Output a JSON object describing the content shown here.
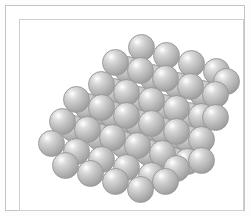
{
  "figure": {
    "background_color": "#fdfdfd",
    "frame": {
      "outer_border_color": "#c4c4c4",
      "inner_border_color": "#cfcfcf",
      "fill_color": "#ffffff"
    },
    "sphere_style": {
      "diameter_px": 27,
      "highlight_color": "#ffffff",
      "body_color": "#c3c3c3",
      "shadow_color": "#8d8d8d",
      "outline_color": "#9a9a9a",
      "highlight_position": "upper-left"
    },
    "lattice": {
      "packing": "close-packed",
      "shape": "rhombohedral",
      "layer_count": 4,
      "sphere_count": 62
    }
  },
  "chart_data": {
    "type": "scatter",
    "xlabel": "",
    "ylabel": "",
    "legend": [],
    "grid": false,
    "xlim": [
      0,
      225
    ],
    "ylim": [
      0,
      192
    ],
    "note": "Each point is the center of one rendered sphere; r = radius in px, layer = stacking depth (0 = back, 3 = front)",
    "spheres": [
      {
        "x": 122,
        "y": 28,
        "r": 13.5,
        "layer": 0
      },
      {
        "x": 147,
        "y": 36,
        "r": 13.5,
        "layer": 0
      },
      {
        "x": 172,
        "y": 44,
        "r": 13.5,
        "layer": 0
      },
      {
        "x": 197,
        "y": 52,
        "r": 13.5,
        "layer": 0
      },
      {
        "x": 108,
        "y": 50,
        "r": 13.5,
        "layer": 0
      },
      {
        "x": 133,
        "y": 58,
        "r": 13.5,
        "layer": 0
      },
      {
        "x": 158,
        "y": 66,
        "r": 13.5,
        "layer": 0
      },
      {
        "x": 183,
        "y": 74,
        "r": 13.5,
        "layer": 0
      },
      {
        "x": 94,
        "y": 72,
        "r": 13.5,
        "layer": 0
      },
      {
        "x": 119,
        "y": 80,
        "r": 13.5,
        "layer": 0
      },
      {
        "x": 144,
        "y": 88,
        "r": 13.5,
        "layer": 0
      },
      {
        "x": 169,
        "y": 96,
        "r": 13.5,
        "layer": 0
      },
      {
        "x": 80,
        "y": 94,
        "r": 13.5,
        "layer": 0
      },
      {
        "x": 105,
        "y": 102,
        "r": 13.5,
        "layer": 0
      },
      {
        "x": 130,
        "y": 110,
        "r": 13.5,
        "layer": 0
      },
      {
        "x": 155,
        "y": 118,
        "r": 13.5,
        "layer": 0
      },
      {
        "x": 96,
        "y": 43,
        "r": 13.5,
        "layer": 1
      },
      {
        "x": 121,
        "y": 51,
        "r": 13.5,
        "layer": 1
      },
      {
        "x": 146,
        "y": 59,
        "r": 13.5,
        "layer": 1
      },
      {
        "x": 171,
        "y": 67,
        "r": 13.5,
        "layer": 1
      },
      {
        "x": 196,
        "y": 75,
        "r": 13.5,
        "layer": 1
      },
      {
        "x": 82,
        "y": 65,
        "r": 13.5,
        "layer": 1
      },
      {
        "x": 107,
        "y": 73,
        "r": 13.5,
        "layer": 1
      },
      {
        "x": 132,
        "y": 81,
        "r": 13.5,
        "layer": 1
      },
      {
        "x": 157,
        "y": 89,
        "r": 13.5,
        "layer": 1
      },
      {
        "x": 182,
        "y": 97,
        "r": 13.5,
        "layer": 1
      },
      {
        "x": 68,
        "y": 87,
        "r": 13.5,
        "layer": 1
      },
      {
        "x": 93,
        "y": 95,
        "r": 13.5,
        "layer": 1
      },
      {
        "x": 118,
        "y": 103,
        "r": 13.5,
        "layer": 1
      },
      {
        "x": 143,
        "y": 111,
        "r": 13.5,
        "layer": 1
      },
      {
        "x": 168,
        "y": 119,
        "r": 13.5,
        "layer": 1
      },
      {
        "x": 54,
        "y": 109,
        "r": 13.5,
        "layer": 1
      },
      {
        "x": 79,
        "y": 117,
        "r": 13.5,
        "layer": 1
      },
      {
        "x": 104,
        "y": 125,
        "r": 13.5,
        "layer": 1
      },
      {
        "x": 129,
        "y": 133,
        "r": 13.5,
        "layer": 1
      },
      {
        "x": 154,
        "y": 141,
        "r": 13.5,
        "layer": 1
      },
      {
        "x": 57,
        "y": 80,
        "r": 13.5,
        "layer": 2
      },
      {
        "x": 82,
        "y": 88,
        "r": 13.5,
        "layer": 2
      },
      {
        "x": 107,
        "y": 96,
        "r": 13.5,
        "layer": 2
      },
      {
        "x": 132,
        "y": 104,
        "r": 13.5,
        "layer": 2
      },
      {
        "x": 157,
        "y": 112,
        "r": 13.5,
        "layer": 2
      },
      {
        "x": 182,
        "y": 120,
        "r": 13.5,
        "layer": 2
      },
      {
        "x": 43,
        "y": 102,
        "r": 13.5,
        "layer": 2
      },
      {
        "x": 68,
        "y": 110,
        "r": 13.5,
        "layer": 2
      },
      {
        "x": 93,
        "y": 118,
        "r": 13.5,
        "layer": 2
      },
      {
        "x": 118,
        "y": 126,
        "r": 13.5,
        "layer": 2
      },
      {
        "x": 143,
        "y": 134,
        "r": 13.5,
        "layer": 2
      },
      {
        "x": 168,
        "y": 142,
        "r": 13.5,
        "layer": 2
      },
      {
        "x": 32,
        "y": 124,
        "r": 13.5,
        "layer": 3
      },
      {
        "x": 57,
        "y": 132,
        "r": 13.5,
        "layer": 3
      },
      {
        "x": 82,
        "y": 140,
        "r": 13.5,
        "layer": 3
      },
      {
        "x": 107,
        "y": 148,
        "r": 13.5,
        "layer": 3
      },
      {
        "x": 132,
        "y": 156,
        "r": 13.5,
        "layer": 3
      },
      {
        "x": 157,
        "y": 149,
        "r": 13.5,
        "layer": 3
      },
      {
        "x": 182,
        "y": 141,
        "r": 13.5,
        "layer": 3
      },
      {
        "x": 46,
        "y": 146,
        "r": 13.5,
        "layer": 3
      },
      {
        "x": 71,
        "y": 154,
        "r": 13.5,
        "layer": 3
      },
      {
        "x": 96,
        "y": 162,
        "r": 13.5,
        "layer": 3
      },
      {
        "x": 121,
        "y": 170,
        "r": 13.5,
        "layer": 3
      },
      {
        "x": 146,
        "y": 162,
        "r": 13.5,
        "layer": 3
      },
      {
        "x": 196,
        "y": 98,
        "r": 13.5,
        "layer": 2
      },
      {
        "x": 207,
        "y": 62,
        "r": 13.5,
        "layer": 1
      }
    ]
  }
}
